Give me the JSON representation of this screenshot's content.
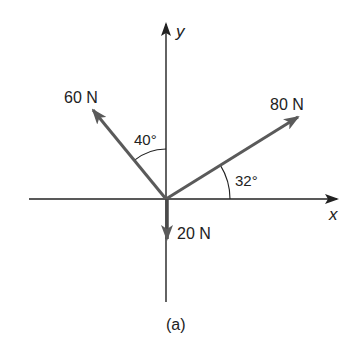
{
  "figure": {
    "caption": "(a)",
    "origin": [
      166,
      199
    ],
    "colors": {
      "axis": "#222222",
      "force": "#5a5a5a",
      "text": "#222222",
      "background": "#ffffff"
    }
  },
  "axes": {
    "x": {
      "label": "x",
      "from": [
        29,
        199
      ],
      "to": [
        337,
        199
      ]
    },
    "y": {
      "label": "y",
      "from": [
        166,
        302
      ],
      "to": [
        166,
        23
      ]
    }
  },
  "forces": [
    {
      "id": "f60",
      "label": "60 N",
      "magnitude": 60,
      "unit": "N",
      "direction": "up-left",
      "angle_from_y_axis_deg": 40,
      "tip": [
        91,
        108
      ]
    },
    {
      "id": "f80",
      "label": "80 N",
      "magnitude": 80,
      "unit": "N",
      "direction": "up-right",
      "angle_from_x_axis_deg": 32,
      "tip": [
        300,
        116
      ]
    },
    {
      "id": "f20",
      "label": "20 N",
      "magnitude": 20,
      "unit": "N",
      "direction": "down",
      "tip": [
        166,
        240
      ]
    }
  ],
  "angles": [
    {
      "id": "a40",
      "label": "40°",
      "between": [
        "60 N",
        "+y axis"
      ]
    },
    {
      "id": "a32",
      "label": "32°",
      "between": [
        "80 N",
        "+x axis"
      ]
    }
  ]
}
